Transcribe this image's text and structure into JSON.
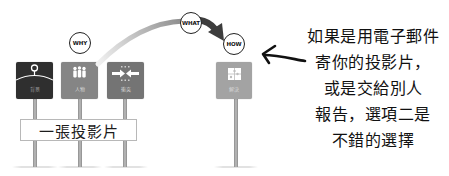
{
  "diagram": {
    "signs": [
      {
        "label": "背景",
        "icon": "location-pin-horizon-icon",
        "color": "#2f2f2f"
      },
      {
        "label": "人物",
        "icon": "people-icon",
        "color": "#858585"
      },
      {
        "label": "衝突",
        "icon": "collision-arrows-icon",
        "color": "#747474"
      },
      {
        "label": "解決",
        "icon": "puzzle-icon",
        "color": "#a3a3a3"
      }
    ],
    "circles": {
      "why": "WHY",
      "what": "WHAT",
      "how": "HOW"
    },
    "flow_arrow": {
      "from": "WHY",
      "via": "WHAT",
      "to": "HOW",
      "colors": {
        "start": "#f0f0f0",
        "end": "#3d3d3d"
      }
    },
    "banner": "一張投影片"
  },
  "note": {
    "lines": [
      "如果是用電子郵件",
      "寄你的投影片，",
      "或是交給別人",
      "報告，選項二是",
      "不錯的選擇"
    ],
    "pointer_icon": "hand-drawn-left-arrow-icon"
  }
}
